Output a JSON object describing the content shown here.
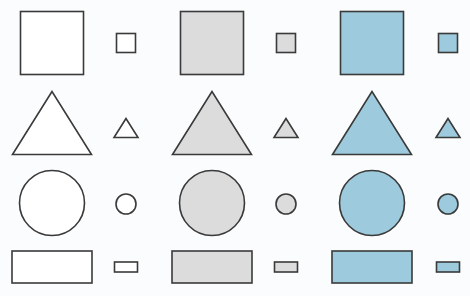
{
  "figure": {
    "width": 470,
    "height": 296,
    "background": "#fbfcfd",
    "stroke_color": "#3a3a3a",
    "fills": {
      "white": "#ffffff",
      "gray": "#dcdcdc",
      "blue": "#9dcbdd"
    },
    "columns": [
      {
        "fill": "white",
        "large_cx": 52,
        "small_cx": 126
      },
      {
        "fill": "gray",
        "large_cx": 212,
        "small_cx": 286
      },
      {
        "fill": "blue",
        "large_cx": 372,
        "small_cx": 448
      }
    ],
    "rows": [
      {
        "shape": "square",
        "large": {
          "w": 63,
          "h": 63,
          "cy": 43
        },
        "small": {
          "w": 19,
          "h": 19,
          "cy": 43
        }
      },
      {
        "shape": "triangle",
        "large": {
          "w": 79,
          "h": 63,
          "cy": 123
        },
        "small": {
          "w": 24,
          "h": 19,
          "cy": 128
        }
      },
      {
        "shape": "circle",
        "large": {
          "r": 32.5,
          "cy": 203
        },
        "small": {
          "r": 10,
          "cy": 204
        }
      },
      {
        "shape": "rectangle",
        "large": {
          "w": 80,
          "h": 32,
          "cy": 267
        },
        "small": {
          "w": 23,
          "h": 10,
          "cy": 267
        }
      }
    ]
  }
}
